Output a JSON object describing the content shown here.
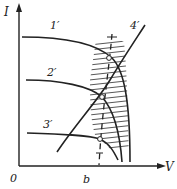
{
  "diagram": {
    "axes": {
      "y_label": "I",
      "x_label": "V",
      "origin_label": "0",
      "x_mark_label": "b"
    },
    "curves": [
      {
        "id": "1",
        "label": "1′"
      },
      {
        "id": "2",
        "label": "2′"
      },
      {
        "id": "3",
        "label": "3′"
      },
      {
        "id": "4",
        "label": "4′"
      }
    ],
    "colors": {
      "ink": "#222222",
      "background": "#ffffff"
    }
  }
}
